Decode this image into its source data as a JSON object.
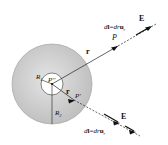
{
  "diagram": {
    "colors": {
      "shell_fill": "#c9c9c9",
      "shell_edge": "#9a9a9a",
      "cavity_fill": "#ffffff",
      "line": "#222222"
    },
    "labels": {
      "r_outer": "r",
      "r_inner": "r",
      "P": "P",
      "P_prime": "P'",
      "P_double_prime": "P''",
      "R1": "R",
      "R1_sub": "1",
      "R2": "R",
      "R2_sub": "2",
      "E_upper": "E",
      "E_lower": "E",
      "dl_upper_d": "d",
      "dl_upper_l": "l",
      "dl_upper_eq": "=",
      "dl_upper_dr": "dr",
      "dl_upper_u": "u",
      "dl_upper_sub": "r",
      "dl_lower_d": "d",
      "dl_lower_l": "l",
      "dl_lower_eq": "=",
      "dl_lower_dr": "dr",
      "dl_lower_u": "u",
      "dl_lower_sub": "r"
    }
  }
}
